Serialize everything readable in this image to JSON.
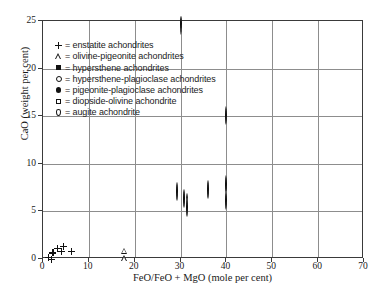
{
  "chart_data": {
    "type": "scatter",
    "title": "",
    "xlabel": "FeO/FeO + MgO  (mole per cent)",
    "ylabel": "CaO (weight per cent)",
    "xlim": [
      0,
      70
    ],
    "ylim": [
      0,
      25
    ],
    "xticks": [
      0,
      10,
      20,
      30,
      40,
      50,
      60,
      70
    ],
    "yticks": [
      0,
      5,
      10,
      15,
      20,
      25
    ],
    "grid": true,
    "legend_position": "upper-left-inside",
    "legend": [
      {
        "symbol": "plus",
        "label": "= enstatite achondrites"
      },
      {
        "symbol": "triangle-open",
        "label": "= olivine-pigeonite achondrites"
      },
      {
        "symbol": "square-filled",
        "label": "= hypersthene achondrites"
      },
      {
        "symbol": "circle-open",
        "label": "= hypersthene-plagioclase achondrites"
      },
      {
        "symbol": "circle-filled",
        "label": "= pigeonite-plagioclase achondrites"
      },
      {
        "symbol": "square-open",
        "label": "= diopside-olivine achondrite"
      },
      {
        "symbol": "diamond-open",
        "label": "= augite achondrite"
      }
    ],
    "series": [
      {
        "name": "enstatite achondrites",
        "symbol": "plus",
        "points": [
          [
            0.4,
            0.5
          ],
          [
            1.0,
            0.3
          ],
          [
            1.4,
            1.0
          ],
          [
            2.3,
            1.5
          ],
          [
            3.2,
            1.2
          ],
          [
            3.6,
            1.7
          ],
          [
            5.4,
            1.2
          ]
        ]
      },
      {
        "name": "olivine-pigeonite achondrites",
        "symbol": "triangle-open",
        "points": [
          [
            17.0,
            1.2
          ],
          [
            17.0,
            0.4
          ]
        ]
      },
      {
        "name": "hypersthene achondrites",
        "symbol": "square-filled",
        "points": [
          [
            22.1,
            2.6
          ],
          [
            22.8,
            0.7
          ],
          [
            25.9,
            0.8
          ],
          [
            26.8,
            1.1
          ],
          [
            27.5,
            1.2
          ],
          [
            28.8,
            0.0
          ],
          [
            29.3,
            1.4
          ],
          [
            32.4,
            1.4
          ]
        ]
      },
      {
        "name": "hypersthene-plagioclase achondrites",
        "symbol": "circle-open",
        "points": [
          [
            29.3,
            7.0
          ],
          [
            30.7,
            6.3
          ],
          [
            31.5,
            5.9
          ],
          [
            31.5,
            5.4
          ],
          [
            36.0,
            7.2
          ],
          [
            40.0,
            7.8
          ],
          [
            40.0,
            6.1
          ],
          [
            40.0,
            15.0
          ]
        ]
      },
      {
        "name": "pigeonite-plagioclase achondrites",
        "symbol": "circle-filled",
        "points": [
          [
            48.3,
            10.8
          ],
          [
            53.0,
            10.2
          ],
          [
            53.0,
            9.9
          ],
          [
            54.0,
            10.2
          ],
          [
            55.0,
            5.8
          ],
          [
            55.5,
            14.5
          ],
          [
            57.0,
            10.1
          ],
          [
            57.5,
            12.2
          ],
          [
            59.8,
            13.2
          ],
          [
            59.8,
            12.0
          ],
          [
            59.8,
            11.3
          ],
          [
            59.8,
            10.3
          ],
          [
            60.0,
            10.2
          ],
          [
            60.2,
            8.8
          ],
          [
            60.2,
            8.4
          ],
          [
            61.0,
            10.1
          ],
          [
            66.0,
            10.3
          ]
        ]
      },
      {
        "name": "diopside-olivine achondrite",
        "symbol": "square-open",
        "points": []
      },
      {
        "name": "augite achondrite",
        "symbol": "diamond-open",
        "points": [
          [
            30.0,
            24.5
          ]
        ]
      }
    ]
  }
}
